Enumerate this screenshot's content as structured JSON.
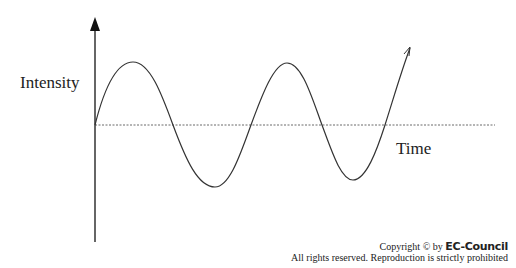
{
  "diagram": {
    "type": "sine-wave-signal",
    "y_axis_label": "Intensity",
    "x_axis_label": "Time",
    "baseline": "dashed",
    "wave_points": [
      [
        95,
        125
      ],
      [
        133,
        62
      ],
      [
        173,
        125
      ],
      [
        215,
        187
      ],
      [
        251,
        125
      ],
      [
        287,
        63
      ],
      [
        322,
        125
      ],
      [
        353,
        180
      ],
      [
        385,
        125
      ],
      [
        410,
        48
      ]
    ],
    "stroke_color": "#333333"
  },
  "footer": {
    "copyright_prefix": "Copyright © by ",
    "brand": "EC-Council",
    "rights": "All rights reserved. Reproduction is strictly prohibited"
  }
}
